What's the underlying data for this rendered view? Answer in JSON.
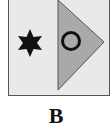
{
  "figure": {
    "label": "B",
    "panel_color": "#e9e9e9",
    "triangle_color": "#a9a9a9",
    "shapes": [
      {
        "name": "star",
        "kind": "six-pointed star",
        "fill": "#111111"
      },
      {
        "name": "triangle",
        "kind": "right-pointing triangle",
        "fill": "#a9a9a9"
      },
      {
        "name": "circle",
        "kind": "ring",
        "stroke": "#111111"
      }
    ]
  }
}
